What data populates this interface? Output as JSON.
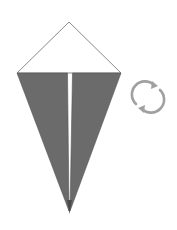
{
  "diagram": {
    "type": "origami-fold-step",
    "colors": {
      "paper_white": "#ffffff",
      "paper_colored": "#6b6b6b",
      "outline": "#777777",
      "icon": "#9a9a9a"
    },
    "points": {
      "apex": [
        69,
        22
      ],
      "left_corner": [
        17,
        73
      ],
      "right_corner": [
        121,
        73
      ],
      "bottom_tip": [
        69,
        213
      ],
      "center_gap_left": 68,
      "center_gap_right": 72
    },
    "symbol": {
      "name": "turn-over-icon",
      "meaning": "turn the model over"
    }
  }
}
